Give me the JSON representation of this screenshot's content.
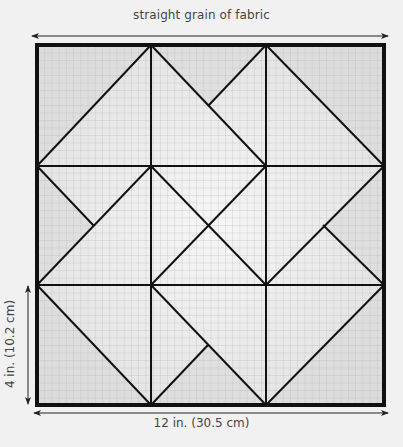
{
  "labels": {
    "top": "straight grain of fabric",
    "bottom": "12 in. (30.5 cm)",
    "side": "4 in. (10.2 cm)"
  },
  "colors": {
    "background": "#f1f1f1",
    "fabric_light": "#f4f4f4",
    "fabric_shade": "#dcdcdc",
    "grid": "#b9b9b9",
    "lines": "#111111",
    "text": "#444444"
  },
  "diagram": {
    "type": "quilt block cutting diagram on graph paper",
    "size_in": 12,
    "unit_in": 4,
    "grid_cells_per_side": 48,
    "layout": "3x3 grid of 4-inch units with diagonal half-square triangle seams"
  }
}
